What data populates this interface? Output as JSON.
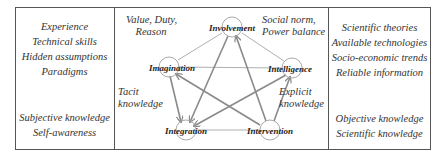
{
  "left_column": {
    "group1": [
      "Experience",
      "Technical skills",
      "Hidden assumptions",
      "Paradigms"
    ],
    "group2": [
      "Subjective knowledge",
      "Self-awareness"
    ]
  },
  "right_column": {
    "group1": [
      "Scientific theories",
      "Available technologies",
      "Socio-economic trends",
      "Reliable information"
    ],
    "group2": [
      "Objective knowledge",
      "Scientific knowledge"
    ]
  },
  "center": {
    "annotations": {
      "top_left": [
        "Value, Duty,",
        "Reason"
      ],
      "top_right": [
        "Social norm,",
        "Power balance"
      ],
      "mid_left": [
        "Tacit",
        "knowledge"
      ],
      "mid_right": [
        "Explicit",
        "knowledge"
      ]
    },
    "nodes": {
      "involvement": "Involvement",
      "imagination": "Imagination",
      "intelligence": "Intelligence",
      "integration": "Integration",
      "intervention": "Intervention"
    },
    "edges_outer": [
      [
        "Involvement",
        "Imagination"
      ],
      [
        "Involvement",
        "Intelligence"
      ],
      [
        "Imagination",
        "Intelligence"
      ],
      [
        "Integration",
        "Intervention"
      ]
    ],
    "arrows": [
      {
        "from": "Involvement",
        "to": "Integration"
      },
      {
        "from": "Intervention",
        "to": "Involvement"
      },
      {
        "from": "Imagination",
        "to": "Integration"
      },
      {
        "from": "Intervention",
        "to": "Imagination"
      },
      {
        "from": "Intelligence",
        "to": "Integration"
      },
      {
        "from": "Intervention",
        "to": "Intelligence"
      }
    ],
    "colors": {
      "line": "#999999",
      "arrow": "#8a8a8a",
      "circle": "#aaaaaa"
    }
  }
}
